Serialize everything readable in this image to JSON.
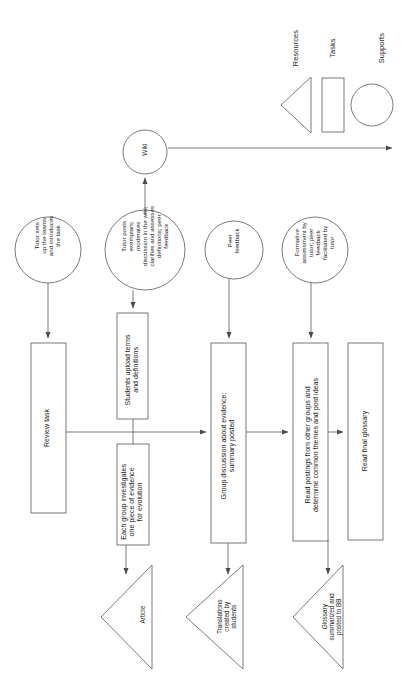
{
  "diagram": {
    "orientation": "rotated-90",
    "stroke_color": "#4a4a4a",
    "text_color": "#1a1a1a",
    "background": "#ffffff"
  },
  "legend": {
    "items": [
      {
        "shape": "triangle",
        "label": "Resources",
        "icon": "triangle-icon"
      },
      {
        "shape": "rectangle",
        "label": "Tasks",
        "icon": "rectangle-icon"
      },
      {
        "shape": "circle",
        "label": "Supports",
        "icon": "circle-icon"
      }
    ]
  },
  "hub": {
    "label": "Wiki"
  },
  "supports": [
    {
      "label": "Tutor sets\nup the teams\nand introduces\nthe task"
    },
    {
      "label": "Tutor posts\nexemplars;\nmoderates\ndiscussion in the wiki;\nclarifies and assesses\ndefinitions; peer\nfeedback"
    },
    {
      "label": "Peer\nfeedback"
    },
    {
      "label": "Formative\nassessment by\ntutor; peer\nfeedback\nfacilitated by\ntutor"
    }
  ],
  "tasks": [
    {
      "label": "Review task"
    },
    {
      "label": "Students upload terms\nand definitions"
    },
    {
      "label": "Each group investigates\none piece of evidence\nfor evolution"
    },
    {
      "label": "Group discussion about evidence;\nsummary posted"
    },
    {
      "label": "Read postings from other groups and\ndetermine common themes and post ideas"
    },
    {
      "label": "Read final glossary"
    }
  ],
  "resources": [
    {
      "label": "Article"
    },
    {
      "label": "Translations\ncreated by\nstudents"
    },
    {
      "label": "Glossary\nsummarized and\nposted to BB"
    }
  ]
}
